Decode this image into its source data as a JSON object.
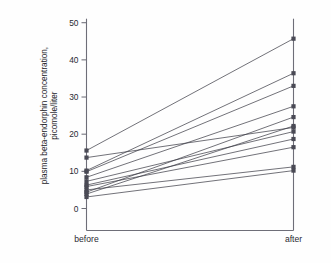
{
  "chart_data": {
    "type": "line",
    "title": "",
    "subtitle": "",
    "xlabel": "",
    "ylabel": "plasma beta-endorphin concentration, picomole/liter",
    "ylabel_lines": [
      "plasma beta-endorphin concentration,",
      "picomole/liter"
    ],
    "categories": [
      "before",
      "after"
    ],
    "x": [
      0,
      1
    ],
    "ylim": [
      0,
      50
    ],
    "xlim": [
      -0.12,
      1.12
    ],
    "yticks": [
      0,
      10,
      20,
      30,
      40,
      50
    ],
    "ytick_labels": [
      "0",
      "10",
      "20",
      "30",
      "40",
      "50"
    ],
    "xticks": [
      0,
      1
    ],
    "xtick_labels": [
      "before",
      "after"
    ],
    "grid": false,
    "legend": false,
    "legend_position": "none",
    "marker": "filled-square",
    "series": [
      {
        "name": "subject-1",
        "values": [
          15.6,
          45.7
        ]
      },
      {
        "name": "subject-2",
        "values": [
          13.7,
          21.8
        ]
      },
      {
        "name": "subject-3",
        "values": [
          10.2,
          36.4
        ]
      },
      {
        "name": "subject-4",
        "values": [
          9.9,
          33.0
        ]
      },
      {
        "name": "subject-5",
        "values": [
          8.4,
          27.5
        ]
      },
      {
        "name": "subject-6",
        "values": [
          7.3,
          20.7
        ]
      },
      {
        "name": "subject-7",
        "values": [
          6.3,
          18.7
        ]
      },
      {
        "name": "subject-8",
        "values": [
          5.9,
          16.5
        ]
      },
      {
        "name": "subject-9",
        "values": [
          5.0,
          11.2
        ]
      },
      {
        "name": "subject-10",
        "values": [
          4.4,
          24.6
        ]
      },
      {
        "name": "subject-11",
        "values": [
          3.9,
          22.2
        ]
      },
      {
        "name": "subject-12",
        "values": [
          3.1,
          10.2
        ]
      }
    ],
    "n_subjects": 12,
    "colors": {
      "line": "#3a3a44",
      "marker": "#4a4a55",
      "axis": "#6e6e78",
      "background": "#fefefe"
    }
  }
}
